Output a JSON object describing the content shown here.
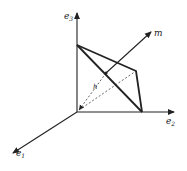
{
  "diagram": {
    "type": "3d-vector-geometry",
    "labels": {
      "e1": "e",
      "e1_sub": "1",
      "e2": "e",
      "e2_sub": "2",
      "e3": "e",
      "e3_sub": "3",
      "m": "m",
      "h": "h"
    },
    "colors": {
      "line": "#222222",
      "background": "#ffffff"
    },
    "points": {
      "origin": [
        77,
        112
      ],
      "e3_tip": [
        77,
        12
      ],
      "e2_tip": [
        173,
        112
      ],
      "e1_tip": [
        13,
        153
      ],
      "plane_top": [
        77,
        45
      ],
      "plane_right": [
        142,
        112
      ],
      "plane_back": [
        136,
        71
      ],
      "h_foot": [
        106,
        73
      ],
      "m_tip": [
        151,
        32
      ]
    }
  }
}
